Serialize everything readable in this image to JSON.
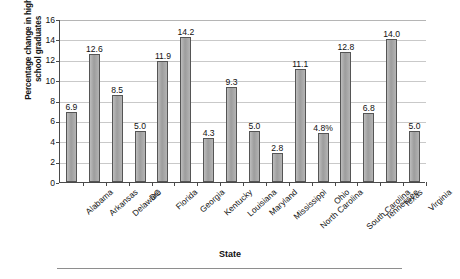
{
  "chart_data": {
    "type": "bar",
    "title": "",
    "xlabel": "State",
    "ylabel": "Percentage change in high school graduates",
    "ylabel_line1": "Percentage change in high",
    "ylabel_line2": "school graduates",
    "ylim": [
      0,
      16
    ],
    "ytick_step": 2,
    "yticks": [
      "0",
      "2",
      "4",
      "6",
      "8",
      "10",
      "12",
      "14",
      "16"
    ],
    "grid": true,
    "legend": "none",
    "categories": [
      "Alabama",
      "Arkansas",
      "Delaware",
      "DC",
      "Florida",
      "Georgia",
      "Kentucky",
      "Louisiana",
      "Maryland",
      "Mississippi",
      "North Carolina",
      "Ohio",
      "South Carolina",
      "Tennessee",
      "Texas",
      "Virginia"
    ],
    "values": [
      6.9,
      12.6,
      8.5,
      5.0,
      11.9,
      14.2,
      4.3,
      9.3,
      5.0,
      2.8,
      11.1,
      4.8,
      12.8,
      6.8,
      14.0,
      5.0
    ],
    "value_labels": [
      "6.9",
      "12.6",
      "8.5",
      "5.0",
      "11.9",
      "14.2",
      "4.3",
      "9.3",
      "5.0",
      "2.8",
      "11.1",
      "4.8%",
      "12.8",
      "6.8",
      "14.0",
      "5.0"
    ],
    "colors": {
      "bar_fill": "#a8a8a8",
      "bar_edge": "#555555",
      "grid": "#c9c9c9",
      "axis": "#4a4a4a",
      "text": "#111111",
      "background": "#ffffff"
    }
  }
}
